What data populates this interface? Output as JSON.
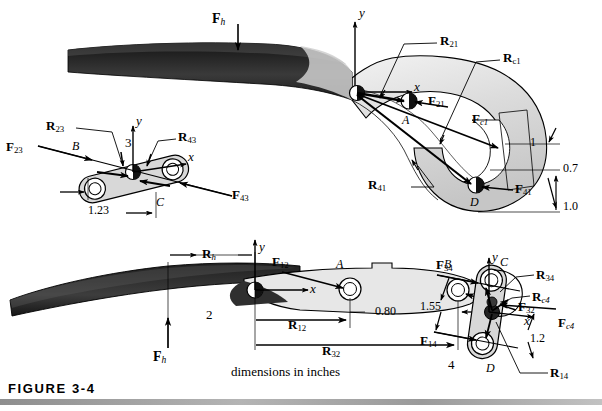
{
  "figure": {
    "caption": "FIGURE 3-4",
    "note": "dimensions in inches"
  },
  "panels": {
    "top_hammer": {
      "name": "link-1-claw-free-body",
      "link_number": "1",
      "applied_force": "F",
      "applied_force_sub": "h",
      "axis_x": "x",
      "axis_y": "y",
      "joints": [
        {
          "label": "A",
          "force": "F",
          "force_sub": "21"
        },
        {
          "label": "D",
          "force": "F",
          "force_sub": "41"
        }
      ],
      "position_vectors": [
        {
          "label": "R",
          "sub": "21"
        },
        {
          "label": "R",
          "sub": "c1"
        },
        {
          "label": "R",
          "sub": "41"
        }
      ],
      "forces": [
        {
          "label": "F",
          "sub": "21"
        },
        {
          "label": "F",
          "sub": "c1"
        },
        {
          "label": "F",
          "sub": "41"
        }
      ],
      "dimensions": [
        "1",
        "0.7",
        "1.0"
      ]
    },
    "link3": {
      "name": "link-3-free-body",
      "link_number": "3",
      "axis_x": "x",
      "axis_y": "y",
      "joints": [
        {
          "label": "B"
        },
        {
          "label": "C"
        }
      ],
      "position_vectors": [
        {
          "label": "R",
          "sub": "23"
        },
        {
          "label": "R",
          "sub": "43"
        }
      ],
      "forces": [
        {
          "label": "F",
          "sub": "23"
        },
        {
          "label": "F",
          "sub": "43"
        }
      ],
      "dimensions": [
        "1.23"
      ]
    },
    "link2": {
      "name": "link-2-handle-free-body",
      "link_number": "2",
      "axis_x": "x",
      "axis_y": "y",
      "applied_force": "F",
      "applied_force_sub": "h",
      "joints": [
        {
          "label": "A"
        },
        {
          "label": "B"
        }
      ],
      "position_vectors": [
        {
          "label": "R",
          "sub": "h"
        },
        {
          "label": "R",
          "sub": "12"
        },
        {
          "label": "R",
          "sub": "32"
        }
      ],
      "forces": [
        {
          "label": "F",
          "sub": "12"
        },
        {
          "label": "F",
          "sub": "32"
        }
      ],
      "dimensions": [
        "0.80"
      ]
    },
    "link4": {
      "name": "link-4-free-body",
      "link_number": "4",
      "axis_x": "x",
      "axis_y": "y",
      "joints": [
        {
          "label": "C"
        },
        {
          "label": "D"
        }
      ],
      "position_vectors": [
        {
          "label": "R",
          "sub": "34"
        },
        {
          "label": "R",
          "sub": "c4"
        },
        {
          "label": "R",
          "sub": "14"
        }
      ],
      "forces": [
        {
          "label": "F",
          "sub": "34"
        },
        {
          "label": "F",
          "sub": "14"
        },
        {
          "label": "F",
          "sub": "c4"
        }
      ],
      "dimensions": [
        "1.55",
        "1.2"
      ]
    }
  },
  "colors": {
    "ink": "#000000",
    "body_fill": "#d8d8d8",
    "light_fill": "#ececec",
    "handle_dark": "#2b2b2b",
    "rule": "#9a9a9a"
  }
}
